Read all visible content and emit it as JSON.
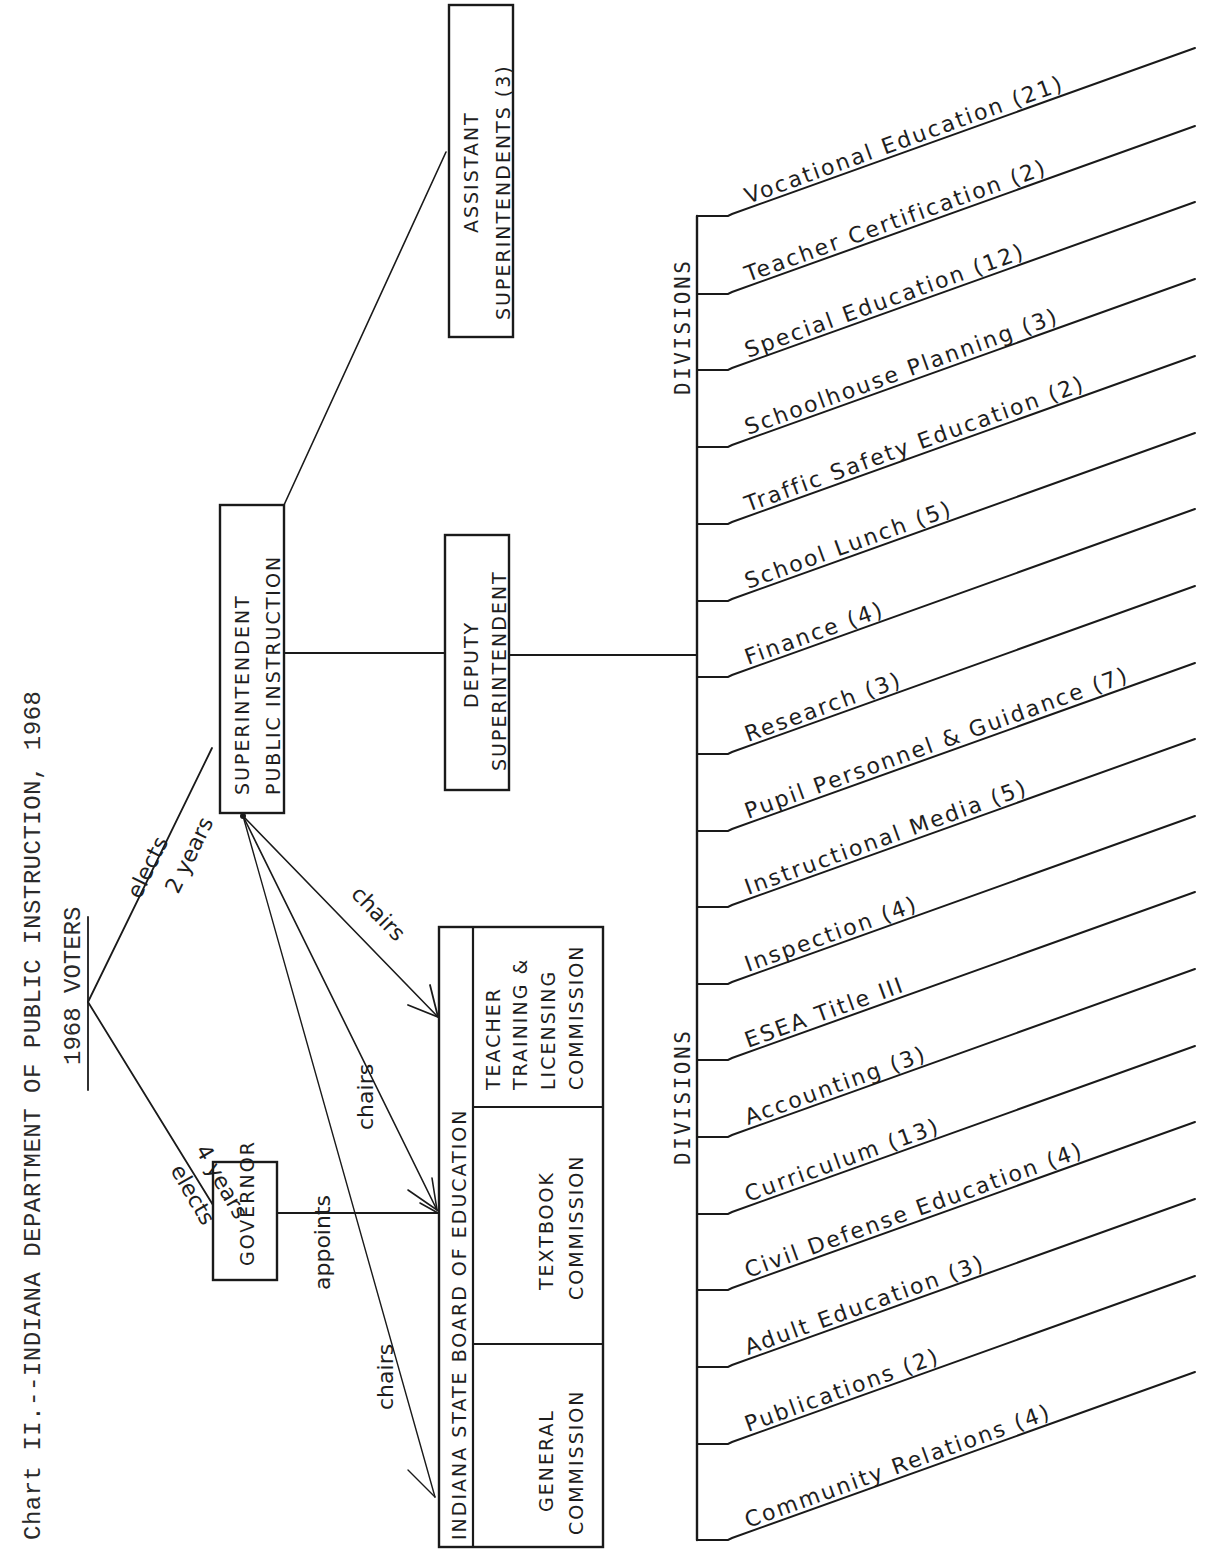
{
  "title": "Chart II.--INDIANA DEPARTMENT OF PUBLIC INSTRUCTION, 1968",
  "voters": {
    "label": "1968 VOTERS"
  },
  "edges": {
    "voters_to_superintendent": {
      "line1": "elects",
      "line2": "2 years"
    },
    "voters_to_governor": {
      "line1": "elects",
      "line2": "4 years"
    },
    "governor_to_board": "appoints",
    "superintendent_chairs_1": "chairs",
    "superintendent_chairs_2": "chairs",
    "superintendent_chairs_3": "chairs"
  },
  "nodes": {
    "governor": "GOVERNOR",
    "superintendent": {
      "line1": "SUPERINTENDENT",
      "line2": "PUBLIC INSTRUCTION"
    },
    "deputy": {
      "line1": "DEPUTY",
      "line2": "SUPERINTENDENT"
    },
    "assistant": {
      "line1": "ASSISTANT",
      "line2": "SUPERINTENDENTS (3)"
    },
    "board": {
      "title": "INDIANA STATE BOARD OF EDUCATION",
      "general": {
        "line1": "GENERAL",
        "line2": "COMMISSION"
      },
      "textbook": {
        "line1": "TEXTBOOK",
        "line2": "COMMISSION"
      },
      "teacher": {
        "line1": "TEACHER",
        "line2": "TRAINING &",
        "line3": "LICENSING",
        "line4": "COMMISSION"
      }
    }
  },
  "divisions": {
    "label_upper": "DIVISIONS",
    "label_lower": "DIVISIONS",
    "items": [
      {
        "name": "Vocational Education",
        "staff": "(21)"
      },
      {
        "name": "Teacher Certification",
        "staff": "(2)"
      },
      {
        "name": "Special Education",
        "staff": "(12)"
      },
      {
        "name": "Schoolhouse Planning",
        "staff": "(3)"
      },
      {
        "name": "Traffic Safety Education",
        "staff": "(2)"
      },
      {
        "name": "School Lunch",
        "staff": "(5)"
      },
      {
        "name": "Finance",
        "staff": "(4)"
      },
      {
        "name": "Research",
        "staff": "(3)"
      },
      {
        "name": "Pupil Personnel & Guidance",
        "staff": "(7)"
      },
      {
        "name": "Instructional Media",
        "staff": "(5)"
      },
      {
        "name": "Inspection",
        "staff": "(4)"
      },
      {
        "name": "ESEA Title III",
        "staff": ""
      },
      {
        "name": "Accounting",
        "staff": "(3)"
      },
      {
        "name": "Curriculum",
        "staff": "(13)"
      },
      {
        "name": "Civil Defense Education",
        "staff": "(4)"
      },
      {
        "name": "Adult Education",
        "staff": "(3)"
      },
      {
        "name": "Publications",
        "staff": "(2)"
      },
      {
        "name": "Community Relations",
        "staff": "(4)"
      }
    ]
  },
  "colors": {
    "ink": "#1a1a1a",
    "paper": "#ffffff"
  }
}
